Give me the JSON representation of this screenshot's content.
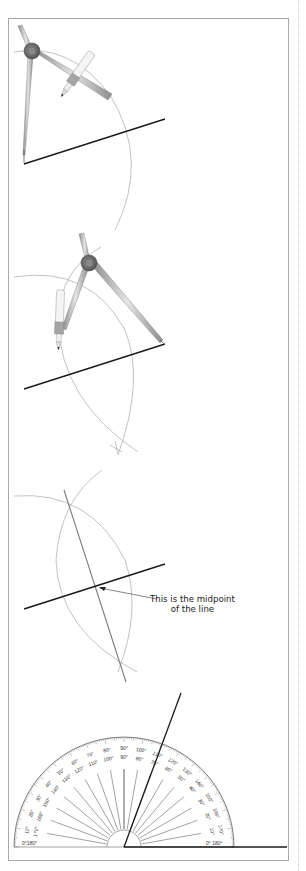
{
  "steps": [
    {
      "id": 1,
      "description": "Compass point placed at left end of line, arc drawn above and below line"
    },
    {
      "id": 2,
      "description": "Compass point placed at right end of line, arc drawn intersecting first arc"
    },
    {
      "id": 3,
      "description": "Line drawn through arc intersections to find midpoint"
    },
    {
      "id": 4,
      "description": "Protractor measuring angle"
    }
  ],
  "annotation": {
    "line1": "This is the midpoint",
    "line2": "of the line"
  },
  "protractor": {
    "outer_labels": [
      "0°",
      "10°",
      "20°",
      "30°",
      "40°",
      "50°",
      "60°",
      "70°",
      "80°",
      "90°",
      "100°",
      "110°",
      "120°",
      "130°",
      "140°",
      "150°",
      "160°",
      "170°",
      "180°"
    ],
    "inner_labels": [
      "180°",
      "170°",
      "160°",
      "150°",
      "140°",
      "130°",
      "120°",
      "110°",
      "100°",
      "90°",
      "80°",
      "70°",
      "60°",
      "50°",
      "40°",
      "30°",
      "20°",
      "10°",
      "0°"
    ],
    "left_base_label": "0°180°",
    "right_base_label": "0° 180°"
  },
  "colors": {
    "line": "#1a1a1a",
    "arc": "#a0a0a0",
    "frame": "#a9a9a9",
    "compass_metal": "#b8b8b8"
  }
}
